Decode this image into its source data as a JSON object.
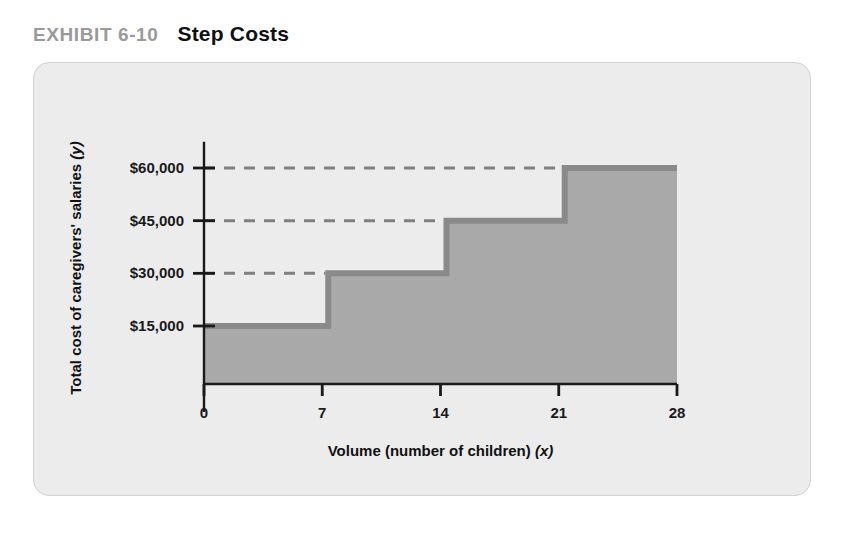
{
  "exhibit": {
    "number": "EXHIBIT 6-10",
    "title": "Step Costs"
  },
  "colors": {
    "page_background": "#ffffff",
    "card_background": "#ececed",
    "card_border": "#d2d2d4",
    "area_fill": "#a9a9aa",
    "step_line": "#8a8a8b",
    "dashed_guide": "#7f7f80",
    "axis": "#1a1a1a",
    "exhibit_number_text": "#9a9a9a",
    "title_text": "#111111"
  },
  "chart_data": {
    "type": "line",
    "title": "Step Costs",
    "xlabel": "Volume (number of children) (x)",
    "ylabel": "Total cost of caregivers' salaries (y)",
    "xlabel_main": "Volume (number of children)",
    "xlabel_variable": "(x)",
    "ylabel_main": "Total cost of caregivers' salaries",
    "ylabel_variable": "(y)",
    "xlim": [
      0,
      28
    ],
    "ylim": [
      0,
      67500
    ],
    "grid": false,
    "legend": null,
    "x_ticks": [
      0,
      7,
      14,
      21,
      28
    ],
    "x_tick_labels": [
      "0",
      "7",
      "14",
      "21",
      "28"
    ],
    "y_ticks": [
      15000,
      30000,
      45000,
      60000
    ],
    "y_tick_labels": [
      "$15,000",
      "$30,000",
      "$45,000",
      "$60,000"
    ],
    "steps": [
      {
        "x_start": 0,
        "x_end": 7,
        "value": 15000,
        "label": "$15,000"
      },
      {
        "x_start": 7,
        "x_end": 14,
        "value": 30000,
        "label": "$30,000"
      },
      {
        "x_start": 14,
        "x_end": 21,
        "value": 45000,
        "label": "$45,000"
      },
      {
        "x_start": 21,
        "x_end": 28,
        "value": 60000,
        "label": "$60,000"
      }
    ],
    "dashed_guides": [
      {
        "y_value": 30000,
        "x_from": 0,
        "x_to": 7
      },
      {
        "y_value": 45000,
        "x_from": 0,
        "x_to": 14
      },
      {
        "y_value": 60000,
        "x_from": 0,
        "x_to": 21
      }
    ],
    "annotations": []
  }
}
